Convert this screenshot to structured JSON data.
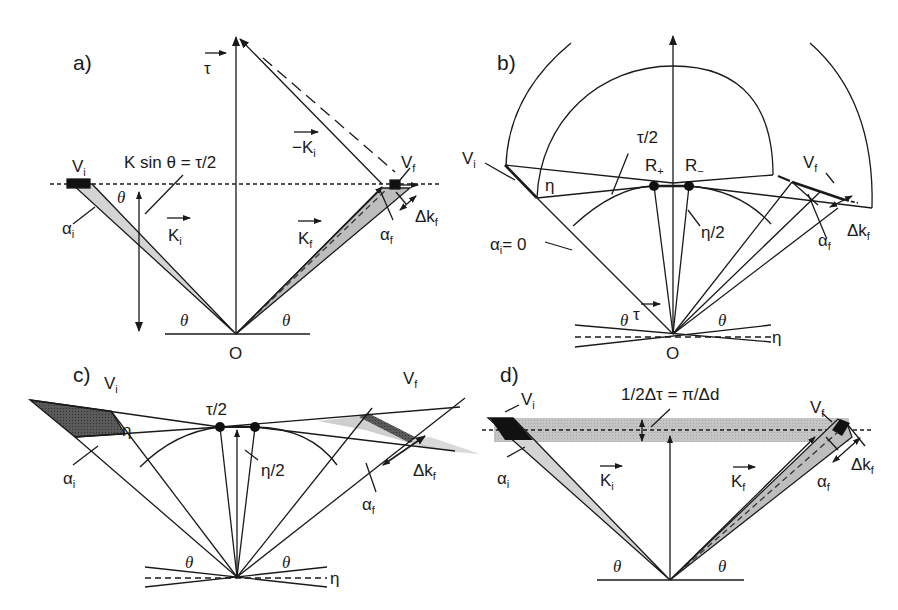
{
  "figure": {
    "type": "reciprocal-space scattering geometry diagram",
    "panels": [
      {
        "id": "a",
        "label": "a)",
        "labels": {
          "tau": "τ",
          "minus_ki": "−K",
          "minus_ki_sub": "i",
          "vi": "V",
          "vi_sub": "i",
          "vf": "V",
          "vf_sub": "f",
          "equation": "K sin θ = τ/2",
          "theta": "θ",
          "ki": "K",
          "ki_sub": "i",
          "kf": "K",
          "kf_sub": "f",
          "alpha_i": "α",
          "alpha_i_sub": "i",
          "alpha_f": "α",
          "alpha_f_sub": "f",
          "delta_kf": "Δk",
          "delta_kf_sub": "f",
          "origin": "O"
        }
      },
      {
        "id": "b",
        "label": "b)",
        "labels": {
          "vi": "V",
          "vi_sub": "i",
          "vf": "V",
          "vf_sub": "f",
          "eta": "η",
          "tau_half": "τ/2",
          "r_plus": "R",
          "r_plus_sub": "+",
          "r_minus": "R",
          "r_minus_sub": "−",
          "eta_half": "η/2",
          "alpha_i_zero": "α",
          "alpha_i_zero_sub": "i",
          "alpha_i_zero_eq": "= 0",
          "alpha_f": "α",
          "alpha_f_sub": "f",
          "delta_kf": "Δk",
          "delta_kf_sub": "f",
          "theta": "θ",
          "tau": "τ",
          "origin": "O"
        }
      },
      {
        "id": "c",
        "label": "c)",
        "labels": {
          "vi": "V",
          "vi_sub": "i",
          "vf": "V",
          "vf_sub": "f",
          "tau_half": "τ/2",
          "eta": "η",
          "eta_half": "η/2",
          "alpha_i": "α",
          "alpha_i_sub": "i",
          "alpha_f": "α",
          "alpha_f_sub": "f",
          "delta_kf": "Δk",
          "delta_kf_sub": "f",
          "theta": "θ"
        }
      },
      {
        "id": "d",
        "label": "d)",
        "labels": {
          "vi": "V",
          "vi_sub": "i",
          "vf": "V",
          "vf_sub": "f",
          "equation": "1/2Δτ = π/Δd",
          "ki": "K",
          "ki_sub": "i",
          "kf": "K",
          "kf_sub": "f",
          "alpha_i": "α",
          "alpha_i_sub": "i",
          "alpha_f": "α",
          "alpha_f_sub": "f",
          "delta_kf": "Δk",
          "delta_kf_sub": "f",
          "theta": "θ"
        }
      }
    ],
    "colors": {
      "ink": "#1a1a1a",
      "light_gray_fill": "#d4d4d4",
      "mid_gray_fill": "#b8b8b8",
      "dark_fill": "#555555",
      "band_fill": "#c2c2c2"
    }
  }
}
